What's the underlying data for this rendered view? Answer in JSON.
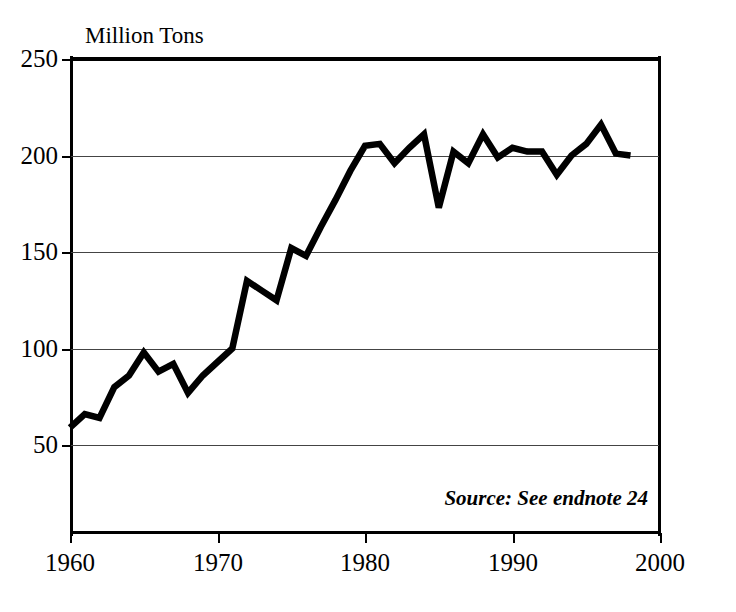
{
  "figure": {
    "axis_title": "Million Tons",
    "source_note": "Source: See endnote 24",
    "line_color": "#000000",
    "grid_color": "#444444",
    "background": "#ffffff"
  },
  "axes": {
    "y_ticks": [
      "250",
      "200",
      "150",
      "100",
      "50"
    ],
    "x_ticks": [
      "1960",
      "1970",
      "1980",
      "1990",
      "2000"
    ]
  },
  "chart_data": {
    "type": "line",
    "title": "",
    "subtitle": "",
    "xlabel": "",
    "ylabel": "Million Tons",
    "xlim": [
      1960,
      2000
    ],
    "ylim": [
      4,
      250
    ],
    "yticks": [
      50,
      100,
      150,
      200,
      250
    ],
    "xticks": [
      1960,
      1970,
      1980,
      1990,
      2000
    ],
    "grid": "horizontal",
    "legend": "none",
    "annotations": [
      "Source: See endnote 24"
    ],
    "series": [
      {
        "name": "Million Tons",
        "x": [
          1960,
          1961,
          1962,
          1963,
          1964,
          1965,
          1966,
          1967,
          1968,
          1969,
          1970,
          1971,
          1972,
          1973,
          1974,
          1975,
          1976,
          1977,
          1978,
          1979,
          1980,
          1981,
          1982,
          1983,
          1984,
          1985,
          1986,
          1987,
          1988,
          1989,
          1990,
          1991,
          1992,
          1993,
          1994,
          1995,
          1996,
          1997,
          1998
        ],
        "values": [
          59,
          66,
          64,
          80,
          86,
          98,
          88,
          92,
          77,
          86,
          93,
          100,
          135,
          130,
          125,
          152,
          148,
          163,
          177,
          192,
          205,
          206,
          196,
          204,
          211,
          173,
          202,
          196,
          211,
          199,
          204,
          202,
          202,
          190,
          200,
          206,
          216,
          201,
          200
        ]
      }
    ]
  }
}
